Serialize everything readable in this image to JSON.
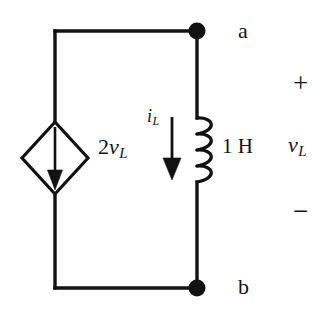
{
  "figure": {
    "type": "circuit-schematic",
    "background_color": "#ffffff",
    "line_color": "#121212"
  },
  "labels": {
    "node_a": "a",
    "node_b": "b",
    "plus_sign": "+",
    "minus_sign": "−",
    "voltage_v": "v",
    "voltage_sub": "L",
    "current_i": "i",
    "current_sub": "L",
    "source_gain": "2",
    "source_v": "v",
    "source_sub": "L",
    "inductance": "1 H"
  },
  "components": [
    {
      "name": "dependent-current-source",
      "symbol": "diamond-with-down-arrow",
      "label": "2vL",
      "value": "2vL",
      "direction": "down"
    },
    {
      "name": "inductor",
      "symbol": "coil-4-loops",
      "label": "1 H",
      "value": "1",
      "unit": "H"
    }
  ],
  "terminals": [
    {
      "name": "a",
      "label": "a",
      "position": "top-right"
    },
    {
      "name": "b",
      "label": "b",
      "position": "bottom-right"
    }
  ],
  "annotations": [
    {
      "name": "inductor-current",
      "label": "iL",
      "direction": "down"
    },
    {
      "name": "terminal-voltage",
      "label": "vL",
      "polarity_top": "+",
      "polarity_bottom": "−"
    }
  ]
}
